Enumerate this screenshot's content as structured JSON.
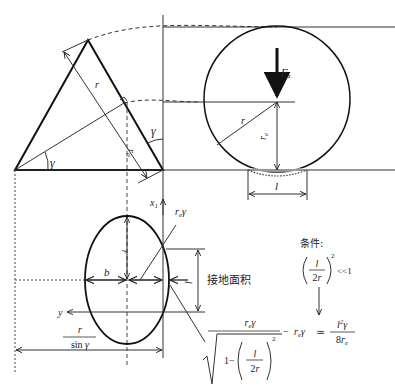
{
  "diagram": {
    "labels": {
      "r": "r",
      "r0": "r₀",
      "re": "r",
      "gamma": "γ",
      "Fz": "F",
      "Fz_sub": "z",
      "l": "l",
      "b": "b",
      "x1": "x",
      "x1_sub": "1",
      "y": "y",
      "re_gamma": "r",
      "re_gamma_sub": "e",
      "re_gamma_tail": "γ",
      "contact_area": "接地面积",
      "condition_label": "条件:",
      "r_over_sin_num": "r",
      "r_over_sin_den": "sin γ"
    },
    "formula": {
      "condition_frac_num": "l",
      "condition_frac_den": "2r",
      "condition_power": "2",
      "condition_rel": "<<1",
      "main_num": "rₑγ",
      "main_one_minus": "1−",
      "main_frac_num": "l",
      "main_frac_den": "2r",
      "main_power": "2",
      "minus_term": "−  rₑγ",
      "approx": "≃",
      "result_num": "l²γ",
      "result_den": "8rₑ"
    },
    "icons": {
      "force_arrow": "down-arrow-icon",
      "implies_arrow": "down-arrow-icon"
    }
  }
}
